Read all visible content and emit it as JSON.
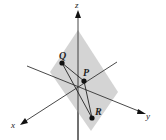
{
  "diagram": {
    "colors": {
      "plane": "#cfcfcf",
      "line": "#222222",
      "point": "#111111",
      "background": "#ffffff"
    },
    "axes": {
      "x": {
        "label": "x"
      },
      "y": {
        "label": "y"
      },
      "z": {
        "label": "z"
      }
    },
    "points": [
      {
        "name": "P",
        "label": "P"
      },
      {
        "name": "Q",
        "label": "Q"
      },
      {
        "name": "R",
        "label": "R"
      }
    ],
    "segments": [
      "QR",
      "PR",
      "QP"
    ]
  }
}
